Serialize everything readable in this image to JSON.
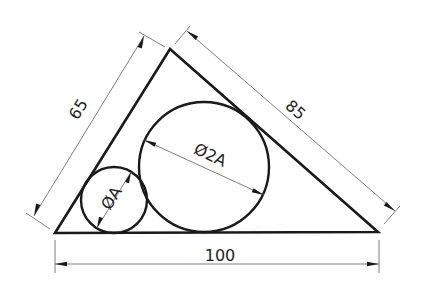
{
  "figure": {
    "type": "engineering drawing",
    "shape": "triangle with two inscribed tangent circles",
    "colors": {
      "outline": "#1a1a1a",
      "dimension_line": "#6f6f6f",
      "text": "#1f1f1f",
      "background": "#ffffff"
    }
  },
  "dimensions": {
    "left_side": "65",
    "right_side": "85",
    "base": "100"
  },
  "circles": {
    "small": {
      "label": "ØA"
    },
    "large": {
      "label": "Ø2A"
    }
  }
}
